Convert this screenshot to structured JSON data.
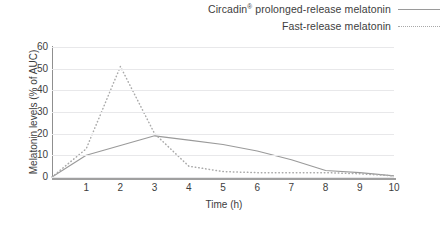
{
  "legend": {
    "position": "top-right",
    "entries": [
      {
        "label": "Circadin® prolonged-release melatonin",
        "style": "solid",
        "color": "#9a9a9a"
      },
      {
        "label": "Fast-release melatonin",
        "style": "dotted",
        "color": "#a8a8a8"
      }
    ]
  },
  "chart_data": {
    "type": "line",
    "title": "",
    "xlabel": "Time (h)",
    "ylabel": "Melatonin levels (% of AUC)",
    "xlim": [
      0,
      10
    ],
    "ylim": [
      0,
      60
    ],
    "xticks": [
      1,
      2,
      3,
      4,
      5,
      6,
      7,
      8,
      9,
      10
    ],
    "yticks": [
      0,
      10,
      20,
      30,
      40,
      50,
      60
    ],
    "grid": "horizontal",
    "x": [
      0,
      1,
      2,
      3,
      4,
      5,
      6,
      7,
      8,
      9,
      10
    ],
    "series": [
      {
        "name": "Circadin® prolonged-release melatonin",
        "style": "solid",
        "color": "#9a9a9a",
        "values": [
          0,
          10,
          14.5,
          19,
          17,
          15,
          12,
          8,
          3,
          2,
          0.5
        ]
      },
      {
        "name": "Fast-release melatonin",
        "style": "dotted",
        "color": "#a8a8a8",
        "values": [
          0,
          13,
          51,
          20,
          5,
          2.5,
          2,
          2,
          2,
          1.5,
          0.5
        ]
      }
    ]
  }
}
